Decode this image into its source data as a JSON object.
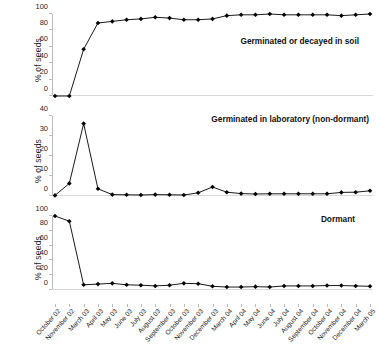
{
  "chart_data": {
    "type": "line",
    "title": "",
    "xlabel": "",
    "ylabel": "% of seeds",
    "grid": false,
    "legend_position": "in-panel annotation",
    "marker": "filled-diamond",
    "line_color": "#000000",
    "categories": [
      "October 02",
      "November 02",
      "March 03",
      "April 03",
      "May 03",
      "June 03",
      "July 03",
      "August 03",
      "September 03",
      "October 03",
      "November 03",
      "December 03",
      "March 04",
      "April 04",
      "May 04",
      "June 04",
      "July 04",
      "August 04",
      "September 04",
      "October 04",
      "November 04",
      "December 04",
      "March 05"
    ],
    "panels": [
      {
        "name": "Germinated or decayed in soil",
        "ylabel": "% of seeds",
        "ylim": [
          0,
          100
        ],
        "yticks": [
          0,
          20,
          40,
          60,
          80,
          100
        ],
        "values": [
          0,
          0,
          57,
          89,
          91,
          93,
          94,
          96,
          95,
          93,
          93,
          94,
          98,
          99,
          99,
          100,
          99,
          99,
          99,
          99,
          98,
          99,
          100
        ]
      },
      {
        "name": "Germinated in laboratory (non-dormant)",
        "ylabel": "% of seeds",
        "ylim": [
          0,
          40
        ],
        "yticks": [
          0,
          10,
          20,
          30,
          40
        ],
        "values": [
          0.3,
          6.3,
          36.2,
          3.6,
          0.7,
          0.6,
          0.5,
          0.7,
          0.6,
          0.5,
          1.6,
          4.5,
          1.9,
          1.2,
          1.0,
          1.1,
          1.1,
          1.1,
          1.1,
          1.1,
          1.8,
          1.9,
          2.6
        ]
      },
      {
        "name": "Dormant",
        "ylabel": "% of seeds",
        "ylim": [
          0,
          100
        ],
        "yticks": [
          0,
          20,
          40,
          60,
          80,
          100
        ],
        "values": [
          100,
          93,
          7,
          8,
          9,
          7,
          6.5,
          5.5,
          6.5,
          9,
          8.5,
          5,
          4,
          4,
          4.5,
          4,
          5.5,
          5.5,
          5.5,
          6,
          6,
          5.5,
          5
        ]
      }
    ]
  }
}
